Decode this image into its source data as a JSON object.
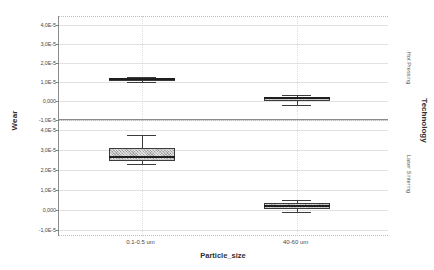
{
  "chart_data": {
    "type": "box",
    "title": "",
    "xlabel": "Particle_size",
    "ylabel": "Wear",
    "strip_variable": "Technology",
    "grid": true,
    "legend_position": "none",
    "categories": [
      "0.1-0.5 um",
      "40-60 um"
    ],
    "panels": [
      {
        "name": "Hot Pressing",
        "ylim": [
          -1e-05,
          4.5e-05
        ],
        "yticks": [
          {
            "value": 4e-05,
            "label": "4,0E-5"
          },
          {
            "value": 3e-05,
            "label": "3,0E-5"
          },
          {
            "value": 2e-05,
            "label": "2,0E-5"
          },
          {
            "value": 1e-05,
            "label": "1,0E-5"
          },
          {
            "value": 0.0,
            "label": "0,000"
          },
          {
            "value": -1e-05,
            "label": "-1,0E-5"
          }
        ],
        "boxes": [
          {
            "category": "0.1-0.5 um",
            "whisker_low": 1.02e-05,
            "q1": 1.08e-05,
            "median": 1.16e-05,
            "q3": 1.24e-05,
            "whisker_high": 1.3e-05
          },
          {
            "category": "40-60 um",
            "whisker_low": -2.2e-06,
            "q1": 2e-07,
            "median": 1.4e-06,
            "q3": 2.4e-06,
            "whisker_high": 3.4e-06
          }
        ]
      },
      {
        "name": "Laser Sintering",
        "ylim": [
          -1.3e-05,
          4.5e-05
        ],
        "yticks": [
          {
            "value": 4e-05,
            "label": "4,0E-5"
          },
          {
            "value": 3e-05,
            "label": "3,0E-5"
          },
          {
            "value": 2e-05,
            "label": "2,0E-5"
          },
          {
            "value": 1e-05,
            "label": "1,0E-5"
          },
          {
            "value": 0.0,
            "label": "0,000"
          },
          {
            "value": -1e-05,
            "label": "-1,0E-5"
          }
        ],
        "boxes": [
          {
            "category": "0.1-0.5 um",
            "whisker_low": 2.28e-05,
            "q1": 2.46e-05,
            "median": 2.66e-05,
            "q3": 3.1e-05,
            "whisker_high": 3.76e-05
          },
          {
            "category": "40-60 um",
            "whisker_low": -1e-06,
            "q1": 6e-07,
            "median": 2.2e-06,
            "q3": 3.4e-06,
            "whisker_high": 5e-06
          }
        ]
      }
    ],
    "colors": {
      "box_fill": "#9e9e9e",
      "box_border": "#3c3c3c",
      "median": "#1e1e1e",
      "grid": "#e2e2e2",
      "axis": "#8a8a8a",
      "text": "#4a4a4a"
    }
  },
  "axis": {
    "y_title": "Wear",
    "x_title": "Particle_size",
    "strip_title": "Technology"
  }
}
